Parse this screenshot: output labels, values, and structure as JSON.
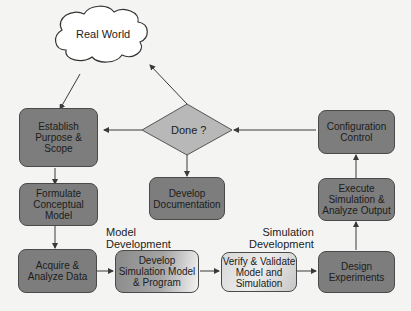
{
  "diagram": {
    "type": "flowchart",
    "nodes": {
      "real_world": "Real World",
      "done": "Done ?",
      "establish": "Establish Purpose & Scope",
      "formulate": "Formulate Conceptual Model",
      "acquire": "Acquire & Analyze Data",
      "develop_sim": "Develop Simulation Model & Program",
      "verify": "Verify & Validate Model and Simulation",
      "design": "Design Experiments",
      "execute": "Execute Simulation & Analyze Output",
      "config": "Configuration Control",
      "documentation": "Develop Documentation"
    },
    "labels": {
      "model_dev_1": "Model",
      "model_dev_2": "Development",
      "sim_dev_1": "Simulation",
      "sim_dev_2": "Development"
    },
    "lines": {
      "establish": [
        "Establish",
        "Purpose &",
        "Scope"
      ],
      "formulate": [
        "Formulate",
        "Conceptual",
        "Model"
      ],
      "acquire": [
        "Acquire &",
        "Analyze Data"
      ],
      "develop_sim": [
        "Develop",
        "Simulation Model",
        "& Program"
      ],
      "verify": [
        "Verify & Validate",
        "Model and",
        "Simulation"
      ],
      "design": [
        "Design",
        "Experiments"
      ],
      "execute": [
        "Execute",
        "Simulation &",
        "Analyze Output"
      ],
      "config": [
        "Configuration",
        "Control"
      ],
      "documentation": [
        "Develop",
        "Documentation"
      ]
    },
    "edges": [
      [
        "real_world",
        "establish"
      ],
      [
        "establish",
        "formulate"
      ],
      [
        "formulate",
        "acquire"
      ],
      [
        "acquire",
        "develop_sim"
      ],
      [
        "develop_sim",
        "verify"
      ],
      [
        "verify",
        "design"
      ],
      [
        "design",
        "execute"
      ],
      [
        "execute",
        "config"
      ],
      [
        "config",
        "done"
      ],
      [
        "done",
        "establish"
      ],
      [
        "done",
        "real_world"
      ],
      [
        "done",
        "documentation"
      ]
    ]
  },
  "colors": {
    "box_dark": "#7d7d7d",
    "diamond": "#b8b8b8",
    "background": "#f4f4f2"
  }
}
